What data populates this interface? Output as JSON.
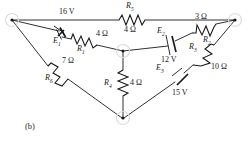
{
  "figure": {
    "caption": "(b)",
    "type": "electrical-circuit-schematic",
    "background_color": "#ffffff",
    "line_color": "#1a1a1a"
  },
  "components": {
    "resistors": [
      {
        "id": "R1",
        "label": "R",
        "subscript": "1",
        "value": "4 Ω",
        "ohms": 4
      },
      {
        "id": "R2",
        "label": "R",
        "subscript": "2",
        "value": "3 Ω",
        "ohms": 3
      },
      {
        "id": "R3",
        "label": "R",
        "subscript": "3",
        "value": "10 Ω",
        "ohms": 10
      },
      {
        "id": "R4",
        "label": "R",
        "subscript": "4",
        "value": "4 Ω",
        "ohms": 4
      },
      {
        "id": "R5",
        "label": "R",
        "subscript": "5",
        "value": "4 Ω",
        "ohms": 4
      },
      {
        "id": "R6",
        "label": "R",
        "subscript": "6",
        "value": "7 Ω",
        "ohms": 7
      }
    ],
    "sources": [
      {
        "id": "E1",
        "label": "E",
        "subscript": "1",
        "value": "16 V",
        "volts": 16
      },
      {
        "id": "E2",
        "label": "E",
        "subscript": "2",
        "value": "12 V",
        "volts": 12
      },
      {
        "id": "E3",
        "label": "E",
        "subscript": "3",
        "value": "15 V",
        "volts": 15
      }
    ]
  },
  "labels": {
    "e1_name": "E",
    "e1_sub": "1",
    "e1_value": "16 V",
    "e2_name": "E",
    "e2_sub": "2",
    "e2_value": "12 V",
    "e3_name": "E",
    "e3_sub": "3",
    "e3_value": "15 V",
    "r1_name": "R",
    "r1_sub": "1",
    "r1_value": "4 Ω",
    "r2_name": "R",
    "r2_sub": "2",
    "r2_value": "3 Ω",
    "r3_name": "R",
    "r3_sub": "3",
    "r3_value": "10 Ω",
    "r4_name": "R",
    "r4_sub": "4",
    "r4_value": "4 Ω",
    "r5_name": "R",
    "r5_sub": "5",
    "r5_value": "4 Ω",
    "r6_name": "R",
    "r6_sub": "6",
    "r6_value": "7 Ω",
    "caption": "(b)"
  }
}
